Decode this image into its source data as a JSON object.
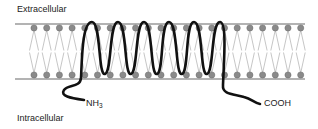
{
  "diagram": {
    "labels": {
      "extracellular": "Extracellular",
      "intracellular": "Intracellular",
      "n_terminus_main": "NH",
      "n_terminus_sub": "3",
      "c_terminus": "COOH"
    },
    "membrane": {
      "x_start": 15,
      "x_end": 305,
      "top_line_y": 24,
      "bottom_line_y": 79,
      "top_head_y": 28,
      "bottom_head_y": 75,
      "head_x_start": 34,
      "head_spacing": 12.7,
      "head_count": 22,
      "line_color": "#9a9a9a",
      "head_color": "#8a8a8a",
      "tail_color": "#a0a0a0"
    },
    "protein": {
      "color": "#111111",
      "stroke_width": 2.6,
      "top_peaks_x": [
        92,
        118,
        144,
        169,
        194,
        220
      ],
      "bottom_loops_x": [
        105,
        131,
        157,
        182,
        207
      ],
      "peak_y": 22,
      "loop_y": 74
    }
  }
}
